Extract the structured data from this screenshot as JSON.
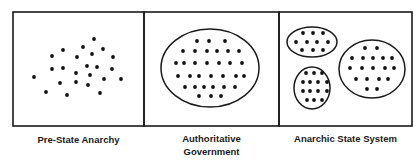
{
  "colors": {
    "stroke": "#1a1a1a",
    "dot": "#111111",
    "background": "#ffffff"
  },
  "panels": [
    {
      "label": "Pre-State Anarchy",
      "enclosures": [],
      "dots": [
        [
          94,
          39
        ],
        [
          83,
          47
        ],
        [
          103,
          49
        ],
        [
          63,
          50
        ],
        [
          92,
          54
        ],
        [
          77,
          57
        ],
        [
          52,
          56
        ],
        [
          113,
          57
        ],
        [
          87,
          66
        ],
        [
          97,
          67
        ],
        [
          52,
          69
        ],
        [
          63,
          68
        ],
        [
          112,
          69
        ],
        [
          76,
          73
        ],
        [
          90,
          75
        ],
        [
          34,
          77
        ],
        [
          104,
          79
        ],
        [
          121,
          79
        ],
        [
          76,
          82
        ],
        [
          60,
          83
        ],
        [
          88,
          85
        ],
        [
          46,
          92
        ],
        [
          67,
          95
        ],
        [
          100,
          93
        ]
      ]
    },
    {
      "label_line1": "Authoritative",
      "label_line2": "Government",
      "enclosures": [
        [
          210,
          68,
          49,
          39
        ]
      ],
      "dots": [
        [
          197,
          41
        ],
        [
          209,
          41
        ],
        [
          225,
          41
        ],
        [
          183,
          51
        ],
        [
          195,
          51
        ],
        [
          207,
          51
        ],
        [
          217,
          51
        ],
        [
          228,
          51
        ],
        [
          239,
          51
        ],
        [
          176,
          63
        ],
        [
          184,
          63
        ],
        [
          195,
          63
        ],
        [
          207,
          63
        ],
        [
          219,
          63
        ],
        [
          230,
          63
        ],
        [
          242,
          63
        ],
        [
          178,
          76
        ],
        [
          190,
          76
        ],
        [
          199,
          76
        ],
        [
          211,
          76
        ],
        [
          223,
          76
        ],
        [
          236,
          76
        ],
        [
          244,
          76
        ],
        [
          185,
          87
        ],
        [
          195,
          87
        ],
        [
          204,
          87
        ],
        [
          213,
          87
        ],
        [
          224,
          87
        ],
        [
          235,
          87
        ],
        [
          199,
          96
        ],
        [
          211,
          96
        ],
        [
          221,
          96
        ]
      ]
    },
    {
      "label": "Anarchic State System",
      "enclosures": [
        [
          312,
          42,
          25,
          15
        ],
        [
          312,
          88,
          18,
          21
        ],
        [
          372,
          69,
          33,
          29
        ]
      ],
      "dots": [
        [
          303,
          33
        ],
        [
          313,
          33
        ],
        [
          323,
          33
        ],
        [
          296,
          42
        ],
        [
          307,
          42
        ],
        [
          317,
          42
        ],
        [
          328,
          42
        ],
        [
          302,
          50
        ],
        [
          313,
          50
        ],
        [
          323,
          50
        ],
        [
          306,
          73
        ],
        [
          314,
          73
        ],
        [
          322,
          73
        ],
        [
          303,
          82
        ],
        [
          310,
          82
        ],
        [
          318,
          82
        ],
        [
          327,
          82
        ],
        [
          303,
          91
        ],
        [
          310,
          91
        ],
        [
          318,
          91
        ],
        [
          327,
          91
        ],
        [
          307,
          100
        ],
        [
          314,
          100
        ],
        [
          322,
          100
        ],
        [
          365,
          48
        ],
        [
          377,
          48
        ],
        [
          352,
          58
        ],
        [
          363,
          58
        ],
        [
          373,
          58
        ],
        [
          383,
          58
        ],
        [
          392,
          58
        ],
        [
          350,
          68
        ],
        [
          362,
          68
        ],
        [
          373,
          68
        ],
        [
          385,
          68
        ],
        [
          394,
          68
        ],
        [
          356,
          79
        ],
        [
          367,
          79
        ],
        [
          379,
          79
        ],
        [
          388,
          79
        ],
        [
          367,
          89
        ],
        [
          377,
          89
        ]
      ]
    }
  ]
}
